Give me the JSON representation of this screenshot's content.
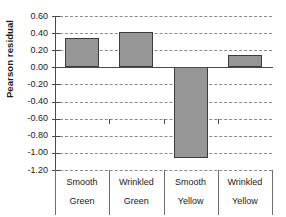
{
  "chart_data": {
    "type": "bar",
    "title": "",
    "xlabel": "",
    "ylabel": "Pearson residual",
    "categories": [
      "Smooth Green",
      "Wrinkled Green",
      "Smooth Yellow",
      "Wrinkled Yellow"
    ],
    "category_lines": [
      [
        "Smooth",
        "Green"
      ],
      [
        "Wrinkled",
        "Green"
      ],
      [
        "Smooth",
        "Yellow"
      ],
      [
        "Wrinkled",
        "Yellow"
      ]
    ],
    "values": [
      0.34,
      0.41,
      -1.06,
      0.14
    ],
    "ylim": [
      -1.2,
      0.6
    ],
    "ytick_labels": [
      "0.60",
      "0.40",
      "0.20",
      "0.00",
      "-0.20",
      "-0.40",
      "-0.60",
      "-0.80",
      "-1.00",
      "-1.20"
    ],
    "ytick_values": [
      0.6,
      0.4,
      0.2,
      0.0,
      -0.2,
      -0.4,
      -0.6,
      -0.8,
      -1.0,
      -1.2
    ],
    "grid": true,
    "legend": false,
    "bar_color": "#969696",
    "bar_border_color": "#3c3c3c",
    "axis_color": "#4a4a4a",
    "gridline_color": "#8a8a8a"
  },
  "axis": {
    "y_title": "Pearson residual"
  }
}
